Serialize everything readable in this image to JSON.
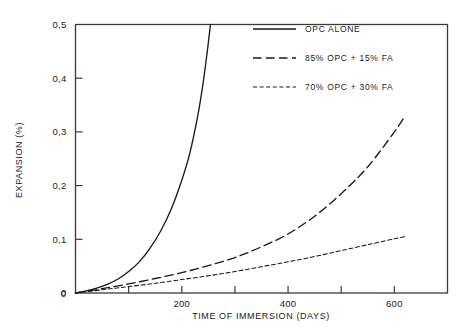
{
  "chart_data": {
    "type": "line",
    "title": "",
    "xlabel": "TIME OF IMMERSION (DAYS)",
    "ylabel": "EXPANSION (%)",
    "xlim": [
      0,
      700
    ],
    "ylim": [
      0,
      0.5
    ],
    "grid": false,
    "legend_position": "top-right-inside",
    "x_tick_labels": [
      "0",
      "200",
      "400",
      "600"
    ],
    "x_tick_values": [
      0,
      200,
      400,
      600
    ],
    "x_minor_ticks": [
      100,
      300,
      500,
      700
    ],
    "y_tick_labels": [
      "0",
      "0,1",
      "0,2",
      "0,3",
      "0,4",
      "0,5"
    ],
    "y_tick_values": [
      0,
      0.1,
      0.2,
      0.3,
      0.4,
      0.5
    ],
    "decimal_separator": ",",
    "series": [
      {
        "name": "OPC ALONE",
        "style": "solid",
        "x": [
          0,
          20,
          40,
          60,
          80,
          100,
          120,
          140,
          160,
          180,
          200,
          215,
          230,
          240,
          248,
          254
        ],
        "values": [
          0.0,
          0.004,
          0.009,
          0.016,
          0.026,
          0.04,
          0.058,
          0.083,
          0.115,
          0.156,
          0.21,
          0.26,
          0.33,
          0.39,
          0.45,
          0.5
        ]
      },
      {
        "name": "85% OPC + 15% FA",
        "style": "dashed-long",
        "x": [
          0,
          50,
          100,
          150,
          200,
          250,
          300,
          350,
          400,
          450,
          500,
          550,
          600,
          620
        ],
        "values": [
          0.0,
          0.008,
          0.017,
          0.027,
          0.038,
          0.051,
          0.066,
          0.086,
          0.11,
          0.143,
          0.185,
          0.235,
          0.3,
          0.33
        ]
      },
      {
        "name": "70% OPC + 30% FA",
        "style": "dashed-short",
        "x": [
          0,
          50,
          100,
          150,
          200,
          250,
          300,
          350,
          400,
          450,
          500,
          550,
          600,
          620
        ],
        "values": [
          0.0,
          0.006,
          0.012,
          0.018,
          0.025,
          0.032,
          0.04,
          0.049,
          0.058,
          0.068,
          0.079,
          0.09,
          0.101,
          0.105
        ]
      }
    ]
  },
  "legend": {
    "items": [
      {
        "label": "OPC ALONE"
      },
      {
        "label": "85% OPC + 15% FA"
      },
      {
        "label": "70% OPC + 30% FA"
      }
    ]
  },
  "colors": {
    "line": "#1a1a1a",
    "frame": "#3a3a3a",
    "background": "#ffffff"
  }
}
